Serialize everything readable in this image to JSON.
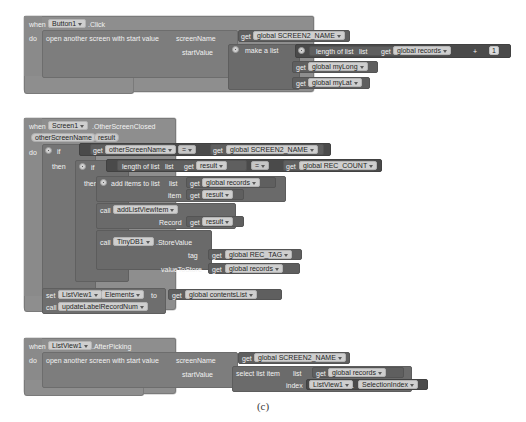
{
  "caption": "(c)",
  "blocks": [
    {
      "id": "block1",
      "when_label": "when",
      "component": "Button1",
      "event": ".Click",
      "do_label": "do",
      "statement": "open another screen with start value",
      "arg1_label": "screenName",
      "arg1_get": "get",
      "arg1_value": "global SCREEN2_NAME",
      "arg2_label": "startValue",
      "make_a_list": "make a list",
      "item1": {
        "length_of_list": "length of list",
        "list_label": "list",
        "get": "get",
        "value": "global records",
        "operator": "+",
        "number": "1"
      },
      "item2": {
        "get": "get",
        "value": "global myLong"
      },
      "item3": {
        "get": "get",
        "value": "global myLat"
      }
    },
    {
      "id": "block2",
      "when_label": "when",
      "component": "Screen1",
      "event": ".OtherScreenClosed",
      "param1": "otherScreenName",
      "param2": "result",
      "do_label": "do",
      "if_label": "if",
      "then_label": "then",
      "cond1": {
        "left_get": "get",
        "left_value": "otherScreenName",
        "operator": "=",
        "right_get": "get",
        "right_value": "global SCREEN2_NAME"
      },
      "cond2": {
        "length_of_list": "length of list",
        "list_label": "list",
        "left_get": "get",
        "left_value": "result",
        "operator": "=",
        "right_get": "get",
        "right_value": "global REC_COUNT"
      },
      "add_items": {
        "statement": "add items to list",
        "list_label": "list",
        "list_get": "get",
        "list_value": "global records",
        "item_label": "item",
        "item_get": "get",
        "item_value": "result"
      },
      "call_add_listviewitem": {
        "call_label": "call",
        "procedure": "addListViewItem",
        "arg_label": "Record",
        "arg_get": "get",
        "arg_value": "result"
      },
      "call_tinydb": {
        "call_label": "call",
        "component": "TinyDB1",
        "method": ".StoreValue",
        "tag_label": "tag",
        "tag_get": "get",
        "tag_value": "global REC_TAG",
        "value_label": "valueToStore",
        "value_get": "get",
        "value_value": "global records"
      },
      "set_elements": {
        "set_label": "set",
        "component": "ListView1",
        "property": "Elements",
        "to_label": "to",
        "get": "get",
        "value": "global contentsList"
      },
      "call_update": {
        "call_label": "call",
        "procedure": "updateLabelRecordNum"
      }
    },
    {
      "id": "block3",
      "when_label": "when",
      "component": "ListView1",
      "event": ".AfterPicking",
      "do_label": "do",
      "statement": "open another screen with start value",
      "arg1_label": "screenName",
      "arg1_get": "get",
      "arg1_value": "global SCREEN2_NAME",
      "arg2_label": "startValue",
      "select_list_item": "select list item",
      "list_label": "list",
      "list_get": "get",
      "list_value": "global records",
      "index_label": "index",
      "index_component": "ListView1",
      "index_dot": ".",
      "index_property": "SelectionIndex"
    }
  ]
}
